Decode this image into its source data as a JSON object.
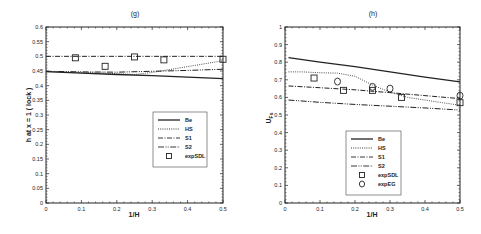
{
  "chart_data": [
    {
      "type": "line",
      "title": "(g)",
      "xlabel": "1/H",
      "ylabel": "h at x = 1 ( lock )",
      "xlim": [
        0,
        0.5
      ],
      "ylim": [
        0,
        0.6
      ],
      "xticks": [
        "0",
        "0.1",
        "0.2",
        "0.3",
        "0.4",
        "0.5"
      ],
      "yticks": [
        "0",
        "0.05",
        "0.1",
        "0.15",
        "0.2",
        "0.25",
        "0.3",
        "0.35",
        "0.4",
        "0.45",
        "0.5",
        "0.55",
        "0.6"
      ],
      "grid": false,
      "legend_position": "center-right",
      "series": [
        {
          "name": "Be",
          "style": "solid",
          "x": [
            0,
            0.1,
            0.2,
            0.3,
            0.4,
            0.5
          ],
          "y": [
            0.448,
            0.443,
            0.438,
            0.434,
            0.429,
            0.424
          ]
        },
        {
          "name": "HS",
          "style": "dotted",
          "x": [
            0,
            0.1,
            0.2,
            0.25,
            0.3,
            0.35,
            0.4,
            0.45,
            0.5
          ],
          "y": [
            0.448,
            0.445,
            0.441,
            0.438,
            0.445,
            0.455,
            0.465,
            0.475,
            0.485
          ]
        },
        {
          "name": "S1",
          "style": "dashdot",
          "x": [
            0,
            0.1,
            0.2,
            0.3,
            0.4,
            0.5
          ],
          "y": [
            0.5,
            0.5,
            0.5,
            0.5,
            0.5,
            0.5
          ]
        },
        {
          "name": "S2",
          "style": "dashdotdot",
          "x": [
            0,
            0.1,
            0.2,
            0.3,
            0.4,
            0.5
          ],
          "y": [
            0.449,
            0.447,
            0.446,
            0.449,
            0.452,
            0.456
          ]
        },
        {
          "name": "expSDL",
          "style": "square",
          "x": [
            0.083,
            0.167,
            0.25,
            0.333,
            0.5
          ],
          "y": [
            0.495,
            0.466,
            0.498,
            0.488,
            0.49
          ]
        }
      ]
    },
    {
      "type": "line",
      "title": "(h)",
      "xlabel": "1/H",
      "ylabel": "U_Fs",
      "xlim": [
        0,
        0.5
      ],
      "ylim": [
        0,
        1
      ],
      "xticks": [
        "0",
        "0.1",
        "0.2",
        "0.3",
        "0.4",
        "0.5"
      ],
      "yticks": [
        "0",
        "0.1",
        "0.2",
        "0.3",
        "0.4",
        "0.5",
        "0.6",
        "0.7",
        "0.8",
        "0.9",
        "1"
      ],
      "grid": false,
      "legend_position": "bottom-center",
      "series": [
        {
          "name": "Be",
          "style": "solid",
          "x": [
            0.01,
            0.1,
            0.2,
            0.3,
            0.4,
            0.5
          ],
          "y": [
            0.826,
            0.8,
            0.775,
            0.745,
            0.715,
            0.688
          ]
        },
        {
          "name": "HS",
          "style": "dotted",
          "x": [
            0.01,
            0.05,
            0.1,
            0.15,
            0.2,
            0.25,
            0.3,
            0.35,
            0.4,
            0.45,
            0.5
          ],
          "y": [
            0.745,
            0.745,
            0.74,
            0.738,
            0.72,
            0.67,
            0.63,
            0.6,
            0.585,
            0.57,
            0.555
          ]
        },
        {
          "name": "S1",
          "style": "dashdot",
          "x": [
            0.01,
            0.1,
            0.2,
            0.3,
            0.4,
            0.5
          ],
          "y": [
            0.665,
            0.655,
            0.643,
            0.627,
            0.61,
            0.593
          ]
        },
        {
          "name": "S2",
          "style": "dashdotdot",
          "x": [
            0.01,
            0.1,
            0.2,
            0.3,
            0.4,
            0.5
          ],
          "y": [
            0.585,
            0.572,
            0.56,
            0.55,
            0.54,
            0.528
          ]
        },
        {
          "name": "expSDL",
          "style": "square",
          "x": [
            0.083,
            0.167,
            0.25,
            0.333,
            0.5
          ],
          "y": [
            0.71,
            0.64,
            0.64,
            0.6,
            0.57
          ]
        },
        {
          "name": "expEG",
          "style": "circle",
          "x": [
            0.15,
            0.25,
            0.3,
            0.5
          ],
          "y": [
            0.69,
            0.66,
            0.65,
            0.61
          ]
        }
      ]
    }
  ],
  "charts": [
    {
      "title": "(g)",
      "xlabel": "1/H",
      "ylabel": "h  at  x = 1 ( lock )"
    },
    {
      "title": "(h)",
      "xlabel": "1/H",
      "ylabel": "U",
      "ylabel_sub": "Fs"
    }
  ]
}
